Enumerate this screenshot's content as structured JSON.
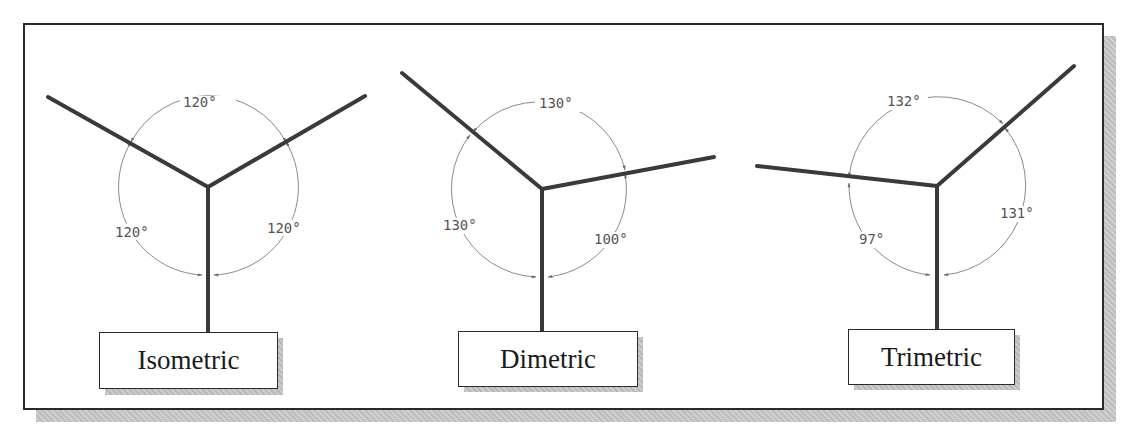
{
  "figure": {
    "caption_fragment": "... original figure ... projection ... approach ... property ...",
    "diagrams": [
      {
        "name": "Isometric",
        "angles": [
          {
            "label": "120°",
            "between": "upper-left axis and upper-right axis"
          },
          {
            "label": "120°",
            "between": "upper-right axis and vertical axis"
          },
          {
            "label": "120°",
            "between": "vertical axis and upper-left axis"
          }
        ]
      },
      {
        "name": "Dimetric",
        "angles": [
          {
            "label": "130°",
            "between": "upper-left axis and right axis"
          },
          {
            "label": "100°",
            "between": "right axis and vertical axis"
          },
          {
            "label": "130°",
            "between": "vertical axis and upper-left axis"
          }
        ]
      },
      {
        "name": "Trimetric",
        "angles": [
          {
            "label": "132°",
            "between": "left axis and upper-right axis"
          },
          {
            "label": "131°",
            "between": "upper-right axis and vertical axis"
          },
          {
            "label": "97°",
            "between": "vertical axis and left axis"
          }
        ]
      }
    ]
  },
  "colors": {
    "axis": "#3a3a3a",
    "arc": "#8a8a8a",
    "text": "#555555",
    "border": "#2a2a2a"
  }
}
